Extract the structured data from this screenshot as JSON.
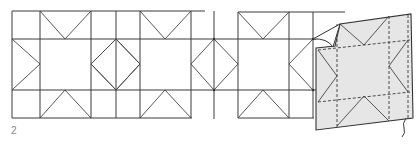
{
  "figure": {
    "label": "2",
    "colors": {
      "line": "#3a3a3a",
      "panel_fill": "#e6e6e6",
      "background": "#ffffff"
    }
  }
}
